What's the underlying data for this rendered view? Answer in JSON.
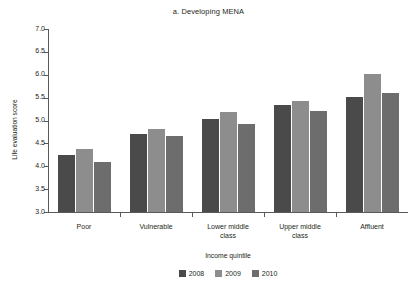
{
  "chart_data": {
    "type": "bar",
    "title": "a. Developing MENA",
    "xlabel": "Income quintile",
    "ylabel": "Life evaluation score",
    "categories": [
      "Poor",
      "Vulnerable",
      "Lower middle class",
      "Upper middle class",
      "Affluent"
    ],
    "series": [
      {
        "name": "2008",
        "color": "#4a4a4a",
        "values": [
          4.25,
          4.7,
          5.03,
          5.33,
          5.51
        ]
      },
      {
        "name": "2009",
        "color": "#8d8d8d",
        "values": [
          4.37,
          4.82,
          5.18,
          5.43,
          6.02
        ]
      },
      {
        "name": "2010",
        "color": "#6d6d6d",
        "values": [
          4.1,
          4.66,
          4.92,
          5.21,
          5.6
        ]
      }
    ],
    "ylim": [
      3.0,
      7.0
    ],
    "ytick_labels": [
      "7.0",
      "6.5",
      "6.0",
      "5.5",
      "5.0",
      "4.5",
      "4.0",
      "3.5",
      "3.0"
    ],
    "ytick_values": [
      7.0,
      6.5,
      6.0,
      5.5,
      5.0,
      4.5,
      4.0,
      3.5,
      3.0
    ],
    "grid": false,
    "legend_position": "bottom",
    "legend_entries": [
      "2008",
      "2009",
      "2010"
    ],
    "axis_color": "#58595b"
  }
}
